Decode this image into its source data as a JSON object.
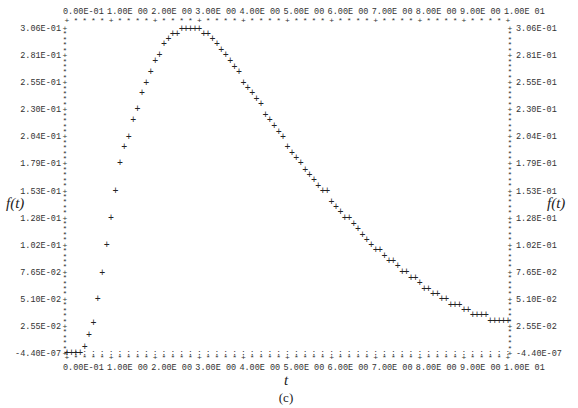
{
  "chart_data": {
    "type": "scatter",
    "title": "",
    "caption": "(c)",
    "xlabel": "t",
    "ylabel": "f(t)",
    "marker": "+",
    "xlim": [
      0,
      10
    ],
    "ylim": [
      -4.4e-07,
      0.306
    ],
    "x_tick_labels": [
      "0.00E-01",
      "1.00E 00",
      "2.00E 00",
      "3.00E 00",
      "4.00E 00",
      "5.00E 00",
      "6.00E 00",
      "7.00E 00",
      "8.00E 00",
      "9.00E 00",
      "1.00E 01"
    ],
    "x_ticks": [
      0,
      1,
      2,
      3,
      4,
      5,
      6,
      7,
      8,
      9,
      10
    ],
    "y_tick_labels": [
      "3.06E-01",
      "2.81E-01",
      "2.55E-01",
      "2.30E-01",
      "2.04E-01",
      "1.79E-01",
      "1.53E-01",
      "1.28E-01",
      "1.02E-01",
      "7.65E-02",
      "5.10E-02",
      "2.55E-02",
      "-4.40E-07"
    ],
    "y_ticks": [
      0.306,
      0.281,
      0.255,
      0.23,
      0.204,
      0.179,
      0.153,
      0.128,
      0.102,
      0.0765,
      0.051,
      0.0255,
      -4.4e-07
    ],
    "x": [
      0.0,
      0.1,
      0.2,
      0.3,
      0.4,
      0.5,
      0.6,
      0.7,
      0.8,
      0.9,
      1.0,
      1.1,
      1.2,
      1.3,
      1.4,
      1.5,
      1.6,
      1.7,
      1.8,
      1.9,
      2.0,
      2.1,
      2.2,
      2.3,
      2.4,
      2.5,
      2.6,
      2.7,
      2.8,
      2.9,
      3.0,
      3.1,
      3.2,
      3.3,
      3.4,
      3.5,
      3.6,
      3.7,
      3.8,
      3.9,
      4.0,
      4.1,
      4.2,
      4.3,
      4.4,
      4.5,
      4.6,
      4.7,
      4.8,
      4.9,
      5.0,
      5.1,
      5.2,
      5.3,
      5.4,
      5.5,
      5.6,
      5.7,
      5.8,
      5.9,
      6.0,
      6.1,
      6.2,
      6.3,
      6.4,
      6.5,
      6.6,
      6.7,
      6.8,
      6.9,
      7.0,
      7.1,
      7.2,
      7.3,
      7.4,
      7.5,
      7.6,
      7.7,
      7.8,
      7.9,
      8.0,
      8.1,
      8.2,
      8.3,
      8.4,
      8.5,
      8.6,
      8.7,
      8.8,
      8.9,
      9.0,
      9.1,
      9.2,
      9.3,
      9.4,
      9.5,
      9.6,
      9.7,
      9.8,
      9.9,
      10.0
    ],
    "values": [
      0.0,
      0.0,
      0.0,
      0.0,
      0.006,
      0.017,
      0.029,
      0.051,
      0.076,
      0.102,
      0.128,
      0.153,
      0.179,
      0.194,
      0.204,
      0.22,
      0.23,
      0.245,
      0.255,
      0.265,
      0.275,
      0.281,
      0.291,
      0.296,
      0.301,
      0.301,
      0.306,
      0.306,
      0.306,
      0.306,
      0.306,
      0.301,
      0.301,
      0.296,
      0.291,
      0.286,
      0.281,
      0.275,
      0.27,
      0.265,
      0.255,
      0.25,
      0.245,
      0.24,
      0.235,
      0.225,
      0.22,
      0.214,
      0.209,
      0.204,
      0.194,
      0.189,
      0.184,
      0.179,
      0.173,
      0.168,
      0.163,
      0.158,
      0.153,
      0.153,
      0.143,
      0.138,
      0.133,
      0.128,
      0.128,
      0.122,
      0.117,
      0.112,
      0.107,
      0.102,
      0.097,
      0.097,
      0.092,
      0.087,
      0.087,
      0.082,
      0.077,
      0.077,
      0.071,
      0.071,
      0.066,
      0.061,
      0.061,
      0.056,
      0.056,
      0.051,
      0.051,
      0.046,
      0.046,
      0.046,
      0.041,
      0.041,
      0.036,
      0.036,
      0.036,
      0.036,
      0.031,
      0.031,
      0.031,
      0.031,
      0.031
    ],
    "grid": false,
    "legend": null
  },
  "labels": {
    "ylabel_left": "f(t)",
    "ylabel_right": "f(t)",
    "xlabel": "t",
    "caption": "(c)"
  }
}
